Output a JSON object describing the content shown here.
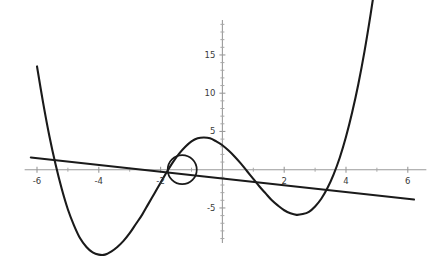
{
  "chart_data": {
    "type": "line",
    "title": "",
    "subtitle": "",
    "xlabel": "",
    "ylabel": "",
    "xlim": [
      -6.4,
      6.6
    ],
    "ylim": [
      -11.5,
      20.0
    ],
    "grid": false,
    "legend": null,
    "x_ticks": [
      -6,
      -4,
      -2,
      2,
      4,
      6
    ],
    "x_tick_labels": [
      "-6",
      "-4",
      "-2",
      "2",
      "4",
      "6"
    ],
    "y_ticks": [
      15,
      10,
      5,
      -5
    ],
    "y_tick_labels": [
      "15",
      "10",
      "5",
      "-5"
    ],
    "x_minor_tick_step": 1,
    "y_minor_tick_step": 1,
    "axis_color": "#9a9a9a",
    "curve_color": "#1a1a1a",
    "series": [
      {
        "name": "quartic-curve",
        "type": "line",
        "color": "#1a1a1a",
        "x": [
          -6.0,
          -5.8,
          -5.6,
          -5.4,
          -5.2,
          -5.0,
          -4.8,
          -4.6,
          -4.4,
          -4.2,
          -4.0,
          -3.8,
          -3.6,
          -3.4,
          -3.2,
          -3.0,
          -2.8,
          -2.6,
          -2.4,
          -2.2,
          -2.0,
          -1.8,
          -1.6,
          -1.4,
          -1.2,
          -1.0,
          -0.8,
          -0.6,
          -0.4,
          -0.2,
          0.0,
          0.2,
          0.4,
          0.6,
          0.8,
          1.0,
          1.2,
          1.4,
          1.6,
          1.8,
          2.0,
          2.2,
          2.4,
          2.6,
          2.8,
          3.0,
          3.2,
          3.4,
          3.6,
          3.8,
          4.0,
          4.2,
          4.4,
          4.6,
          4.8,
          5.0,
          5.2,
          5.4
        ],
        "y": [
          13.5,
          8.7,
          4.4,
          0.7,
          -2.5,
          -5.2,
          -7.3,
          -9.0,
          -10.1,
          -10.8,
          -11.1,
          -11.1,
          -10.7,
          -10.1,
          -9.3,
          -8.3,
          -7.1,
          -5.9,
          -4.5,
          -3.1,
          -1.7,
          -0.3,
          1.0,
          2.1,
          3.0,
          3.7,
          4.1,
          4.2,
          4.1,
          3.7,
          3.2,
          2.5,
          1.7,
          0.8,
          -0.2,
          -1.2,
          -2.2,
          -3.1,
          -4.0,
          -4.7,
          -5.3,
          -5.7,
          -5.9,
          -5.8,
          -5.5,
          -4.8,
          -3.8,
          -2.4,
          -0.6,
          1.6,
          4.3,
          7.5,
          11.2,
          15.5,
          20.4,
          25.8,
          31.9,
          38.6
        ]
      },
      {
        "name": "straight-line",
        "type": "line",
        "color": "#1a1a1a",
        "x": [
          -6.2,
          6.2
        ],
        "y": [
          1.6,
          -3.9
        ]
      }
    ],
    "annotations": [
      {
        "name": "intersection-highlight-circle",
        "shape": "circle",
        "center_x": -1.3,
        "center_y": 0.0,
        "radius_x": 0.47,
        "radius_y": 2.0,
        "color": "#1a1a1a"
      }
    ]
  }
}
